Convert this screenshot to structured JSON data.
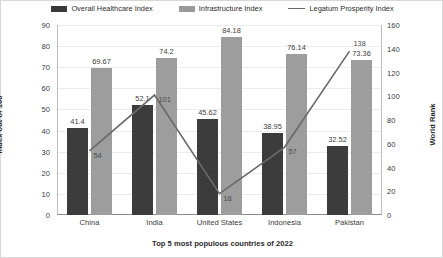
{
  "chart_data": {
    "type": "bar",
    "title": "",
    "xlabel": "Top 5 most populous countries of 2022",
    "ylabel": "Index out of 100",
    "y2label": "World Rank",
    "categories": [
      "China",
      "India",
      "United States",
      "Indonesia",
      "Pakistan"
    ],
    "ylim": [
      0,
      90
    ],
    "y2lim": [
      0,
      160
    ],
    "yticks": [
      0,
      10,
      20,
      30,
      40,
      50,
      60,
      70,
      80,
      90
    ],
    "y2ticks": [
      0,
      20,
      40,
      60,
      80,
      100,
      120,
      140,
      160
    ],
    "grid": true,
    "legend_position": "top",
    "series": [
      {
        "name": "Overall Healthcare Index",
        "type": "bar",
        "axis": "left",
        "color": "#3c3c3c",
        "values": [
          41.4,
          52.1,
          45.62,
          38.95,
          32.52
        ],
        "labels": [
          "41.4",
          "52.1",
          "45.62",
          "38.95",
          "32.52"
        ]
      },
      {
        "name": "Infrastructure Index",
        "type": "bar",
        "axis": "left",
        "color": "#9d9d9d",
        "values": [
          69.67,
          74.2,
          84.18,
          76.14,
          73.36
        ],
        "labels": [
          "69.67",
          "74.2",
          "84.18",
          "76.14",
          "73.36"
        ]
      },
      {
        "name": "Legatum Prosperity Index",
        "type": "line",
        "axis": "right",
        "color": "#6a6a6a",
        "values": [
          54,
          101,
          18,
          57,
          138
        ],
        "labels": [
          "54",
          "101",
          "18",
          "57",
          "138"
        ]
      }
    ]
  },
  "legend": {
    "items": [
      {
        "label": "Overall Healthcare Index",
        "marker": "dark-bar-swatch"
      },
      {
        "label": "Infrastructure Index",
        "marker": "light-bar-swatch"
      },
      {
        "label": "Legatum Prosperity Index",
        "marker": "line-swatch"
      }
    ]
  },
  "axes": {
    "left_title": "Index out of 100",
    "right_title": "World Rank",
    "bottom_title": "Top 5 most populous countries of 2022"
  }
}
